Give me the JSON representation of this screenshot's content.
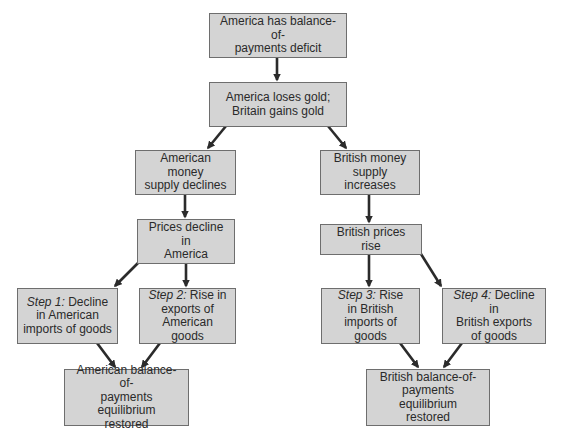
{
  "diagram": {
    "type": "flowchart",
    "nodes": [
      {
        "id": "n1",
        "text": "America has balance-of-payments deficit",
        "lines": [
          "America has balance-of-",
          "payments deficit"
        ]
      },
      {
        "id": "n2",
        "text": "America loses gold; Britain gains gold",
        "lines": [
          "America loses gold;",
          "Britain gains gold"
        ]
      },
      {
        "id": "n3",
        "text": "American money supply declines",
        "lines": [
          "American money",
          "supply declines"
        ]
      },
      {
        "id": "n4",
        "text": "British money supply increases",
        "lines": [
          "British money",
          "supply increases"
        ]
      },
      {
        "id": "n5",
        "text": "Prices decline in America",
        "lines": [
          "Prices decline in",
          "America"
        ]
      },
      {
        "id": "n6",
        "text": "British prices rise",
        "lines": [
          "British prices rise"
        ]
      },
      {
        "id": "n7",
        "step_label": "Step 1:",
        "text": "Decline in American imports of goods",
        "lines": [
          " Decline",
          "in American",
          "imports of goods"
        ]
      },
      {
        "id": "n8",
        "step_label": "Step 2:",
        "text": "Rise in exports of American goods",
        "lines": [
          " Rise in",
          "exports of",
          "American goods"
        ]
      },
      {
        "id": "n9",
        "text": "American balance-of-payments equilibrium restored",
        "lines": [
          "American balance-of-",
          "payments equilibrium",
          "restored"
        ]
      },
      {
        "id": "n10",
        "step_label": "Step 3:",
        "text": "Rise in British imports of goods",
        "lines": [
          " Rise",
          "in British",
          "imports of goods"
        ]
      },
      {
        "id": "n11",
        "step_label": "Step 4:",
        "text": "Decline in British exports of goods",
        "lines": [
          " Decline in",
          "British exports",
          "of goods"
        ]
      },
      {
        "id": "n12",
        "text": "British balance-of-payments equilibrium restored",
        "lines": [
          "British balance-of-",
          "payments equilibrium",
          "restored"
        ]
      }
    ],
    "edges": [
      {
        "from": "n1",
        "to": "n2"
      },
      {
        "from": "n2",
        "to": "n3"
      },
      {
        "from": "n2",
        "to": "n4"
      },
      {
        "from": "n3",
        "to": "n5"
      },
      {
        "from": "n4",
        "to": "n6"
      },
      {
        "from": "n5",
        "to": "n7"
      },
      {
        "from": "n5",
        "to": "n8"
      },
      {
        "from": "n6",
        "to": "n10"
      },
      {
        "from": "n6",
        "to": "n11"
      },
      {
        "from": "n7",
        "to": "n9"
      },
      {
        "from": "n8",
        "to": "n9"
      },
      {
        "from": "n10",
        "to": "n12"
      },
      {
        "from": "n11",
        "to": "n12"
      }
    ],
    "colors": {
      "box_fill": "#d4d4d4",
      "box_border": "#6e6e6e",
      "text": "#2a2a2a",
      "arrow": "#2b2b2b",
      "background": "#ffffff"
    }
  }
}
